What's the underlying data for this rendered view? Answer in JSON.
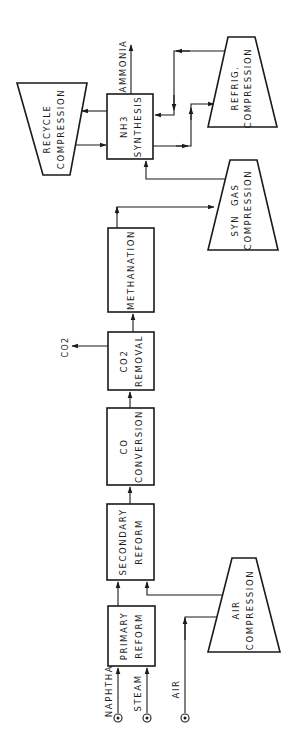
{
  "diagram": {
    "orientation": "rotated-90-ccw",
    "units": [
      {
        "id": "primary_reform",
        "lines": [
          "PRIMARY",
          "REFORM"
        ]
      },
      {
        "id": "secondary_reform",
        "lines": [
          "SECONDARY",
          "REFORM"
        ]
      },
      {
        "id": "co_conversion",
        "lines": [
          "CO",
          "CONVERSION"
        ]
      },
      {
        "id": "co2_removal",
        "lines": [
          "CO2",
          "REMOVAL"
        ]
      },
      {
        "id": "methanation",
        "lines": [
          "METHANATION"
        ]
      },
      {
        "id": "nh3_synthesis",
        "lines": [
          "NH3",
          "SYNTHESIS"
        ]
      }
    ],
    "compressors": [
      {
        "id": "air_compression",
        "lines": [
          "AIR",
          "COMPRESSION"
        ]
      },
      {
        "id": "syn_gas_compression",
        "lines": [
          "SYN  GAS",
          "COMPRESSION"
        ]
      },
      {
        "id": "refrig_compression",
        "lines": [
          "REFRIG.",
          "COMPRESSION"
        ]
      },
      {
        "id": "recycle_compression",
        "lines": [
          "RECYCLE",
          "COMPRESSION"
        ]
      }
    ],
    "inputs": [
      {
        "id": "naphtha",
        "label": "NAPHTHA"
      },
      {
        "id": "steam",
        "label": "STEAM"
      },
      {
        "id": "air",
        "label": "AIR"
      }
    ],
    "outputs": [
      {
        "id": "co2",
        "label": "CO2"
      },
      {
        "id": "ammonia",
        "label": "AMMONIA"
      }
    ],
    "flows": [
      {
        "from": "naphtha",
        "to": "primary_reform"
      },
      {
        "from": "steam",
        "to": "primary_reform"
      },
      {
        "from": "air",
        "to": "air_compression"
      },
      {
        "from": "air_compression",
        "to": "secondary_reform"
      },
      {
        "from": "primary_reform",
        "to": "secondary_reform"
      },
      {
        "from": "secondary_reform",
        "to": "co_conversion"
      },
      {
        "from": "co_conversion",
        "to": "co2_removal"
      },
      {
        "from": "co2_removal",
        "to": "co2"
      },
      {
        "from": "co2_removal",
        "to": "methanation"
      },
      {
        "from": "methanation",
        "to": "syn_gas_compression"
      },
      {
        "from": "syn_gas_compression",
        "to": "nh3_synthesis"
      },
      {
        "from": "nh3_synthesis",
        "to": "ammonia"
      },
      {
        "from": "nh3_synthesis",
        "to": "recycle_compression"
      },
      {
        "from": "recycle_compression",
        "to": "nh3_synthesis"
      },
      {
        "from": "nh3_synthesis",
        "to": "refrig_compression"
      },
      {
        "from": "refrig_compression",
        "to": "nh3_synthesis"
      }
    ],
    "colors": {
      "ink": "#1a1a1a",
      "paper": "#ffffff"
    }
  }
}
